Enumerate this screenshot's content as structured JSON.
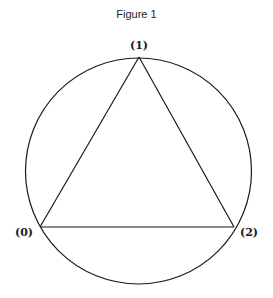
{
  "figure": {
    "title": "Figure 1",
    "circle": {
      "cx": 138.5,
      "cy": 171,
      "r": 113
    },
    "vertices": [
      {
        "label": "(0)",
        "x": 40,
        "y": 227,
        "label_x": 24,
        "label_y": 236
      },
      {
        "label": "(1)",
        "x": 139,
        "y": 57,
        "label_x": 139,
        "label_y": 49
      },
      {
        "label": "(2)",
        "x": 234,
        "y": 227,
        "label_x": 249,
        "label_y": 236
      }
    ],
    "edges": [
      [
        0,
        1
      ],
      [
        1,
        2
      ],
      [
        0,
        2
      ]
    ],
    "colors": {
      "stroke": "#1a1a1a",
      "background": "#ffffff"
    }
  }
}
